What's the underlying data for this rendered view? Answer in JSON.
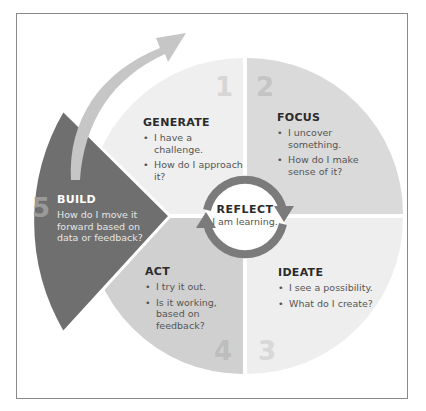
{
  "diagram": {
    "colors": {
      "generate_fill": "#efefef",
      "focus_fill": "#dadada",
      "ideate_fill": "#eeeeee",
      "act_fill": "#d0d0d0",
      "build_fill": "#6f6f6f",
      "arrow_fill": "#c6c6c6",
      "ring_stroke": "#7b7b7b",
      "number_color": "#cfcfcf"
    },
    "center": {
      "title": "REFLECT",
      "subtitle": "I am learning."
    },
    "stages": [
      {
        "number": "1",
        "title": "GENERATE",
        "bullets": [
          "I have a challenge.",
          "How do I approach it?"
        ]
      },
      {
        "number": "2",
        "title": "FOCUS",
        "bullets": [
          "I uncover something.",
          "How do I make sense of it?"
        ]
      },
      {
        "number": "3",
        "title": "IDEATE",
        "bullets": [
          "I see a possibility.",
          "What do I create?"
        ]
      },
      {
        "number": "4",
        "title": "ACT",
        "bullets": [
          "I try it out.",
          "Is it working, based on feedback?"
        ]
      },
      {
        "number": "5",
        "title": "BUILD",
        "description": "How do I move it forward based on data or feedback?"
      }
    ]
  }
}
